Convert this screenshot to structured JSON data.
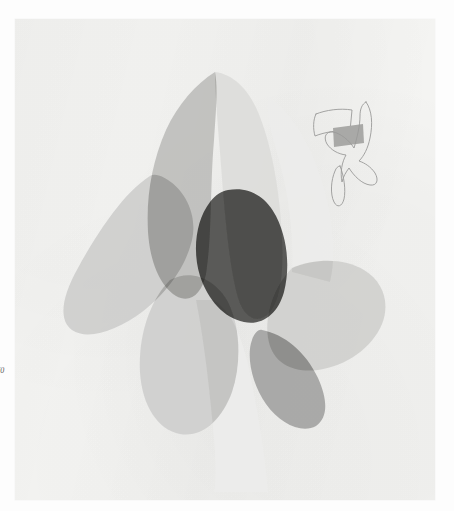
{
  "page": {
    "kind": "scanned-book-plate",
    "background_color": "#fdfdfd",
    "paper_color": "#f4f4f2",
    "paper_rect": [
      15,
      19,
      420,
      481
    ]
  },
  "caption": {
    "text": "70",
    "note": "clipped at left page margin"
  },
  "palette": {
    "paper": "#f4f4f2",
    "tone_lightest": "#ececeb",
    "tone_light": "#dcdcda",
    "tone_pale": "#cfcfcd",
    "tone_mid": "#bcbcba",
    "tone_medium": "#9e9e9c",
    "tone_dark": "#7c7c7a",
    "tone_darkest": "#545452",
    "ink_line": "#9a9a98"
  },
  "artwork": {
    "title_semantic": "abstract-overlapping-curved-forms",
    "shapes": [
      {
        "name": "left-lobe",
        "fill": "#cfcfcd",
        "opacity": 0.95,
        "path": "M 150 176 C 125 192 100 228 78 268 C 62 296 58 320 72 330 C 88 341 118 330 142 312 C 168 292 186 266 192 240 C 198 214 184 190 168 180 C 162 176 155 173 150 176 Z"
      },
      {
        "name": "upper-peak-left-wing",
        "fill": "#bcbcba",
        "opacity": 0.9,
        "path": "M 215 72 C 196 84 178 104 166 130 C 152 162 146 196 148 232 C 150 262 160 286 176 296 C 190 304 202 294 206 274 C 212 238 210 186 214 140 C 216 110 218 88 215 72 Z"
      },
      {
        "name": "upper-peak-right-wing",
        "fill": "#dcdcda",
        "opacity": 0.92,
        "path": "M 215 72 C 232 74 248 88 258 112 C 272 146 280 192 282 238 C 284 274 280 300 270 312 C 258 326 244 318 238 298 C 228 262 224 204 220 152 C 217 116 215 90 215 72 Z"
      },
      {
        "name": "central-dark-core",
        "fill": "#545452",
        "opacity": 0.97,
        "path": "M 228 190 C 248 186 266 196 276 216 C 288 240 290 268 284 292 C 278 314 262 326 244 322 C 224 318 208 300 200 276 C 192 250 196 220 210 202 C 216 194 222 191 228 190 Z"
      },
      {
        "name": "right-lobe",
        "fill": "#cfcfcd",
        "opacity": 0.9,
        "path": "M 292 268 C 316 258 344 258 364 270 C 384 282 390 304 382 324 C 372 348 346 366 318 370 C 294 373 276 364 270 346 C 262 322 272 288 292 268 Z"
      },
      {
        "name": "lower-left-bulb",
        "fill": "#cfcfcd",
        "opacity": 0.93,
        "path": "M 170 280 C 150 300 138 336 140 372 C 142 406 158 430 180 434 C 202 438 222 420 232 392 C 242 362 240 326 228 302 C 216 280 192 268 170 280 Z"
      },
      {
        "name": "lower-right-wedge",
        "fill": "#9e9e9c",
        "opacity": 0.85,
        "path": "M 262 330 C 284 334 306 352 318 378 C 328 400 328 418 316 426 C 302 434 280 424 266 404 C 252 384 246 356 252 340 C 254 334 258 329 262 330 Z"
      },
      {
        "name": "faint-vertical-band",
        "fill": "#ececeb",
        "opacity": 0.85,
        "path": "M 196 300 C 204 340 210 392 214 440 C 216 466 216 482 214 492 L 268 492 C 266 462 258 410 248 364 C 240 330 228 308 214 300 Z"
      },
      {
        "name": "upper-right-veil",
        "fill": "#ececeb",
        "opacity": 0.8,
        "path": "M 268 96 C 292 112 312 146 324 188 C 334 224 336 258 330 282 L 292 272 C 294 234 288 188 276 150 C 270 128 266 110 268 96 Z"
      }
    ],
    "doodle": {
      "name": "bird-outline-doodle",
      "stroke": "#9a9a98",
      "stroke_width": 0.9,
      "fill_patch_color": "#a9a9a7",
      "bbox": [
        312,
        98,
        72,
        84
      ],
      "outline_path": "M 366 102 C 372 110 373 124 370 138 C 368 148 364 156 359 161 C 365 163 371 167 375 173 C 379 180 377 186 370 185 C 362 184 354 176 349 168 C 346 172 343 177 342 182 C 340 172 342 162 346 155 C 338 154 331 150 327 144 C 323 137 326 131 333 132 C 340 133 349 140 354 148 C 357 138 360 126 360 116 C 360 109 362 104 366 102 Z",
      "flag_path": "M 316 114 C 326 110 340 108 352 110 L 350 131 C 338 130 325 132 315 136 C 313 129 313 120 316 114 Z",
      "tail_path": "M 340 166 C 344 176 346 190 344 199 C 342 207 337 208 334 202 C 330 194 331 180 335 171 C 336 168 338 166 340 166 Z",
      "patch_path": "M 333 128 L 363 124 L 364 143 L 334 147 Z"
    }
  }
}
